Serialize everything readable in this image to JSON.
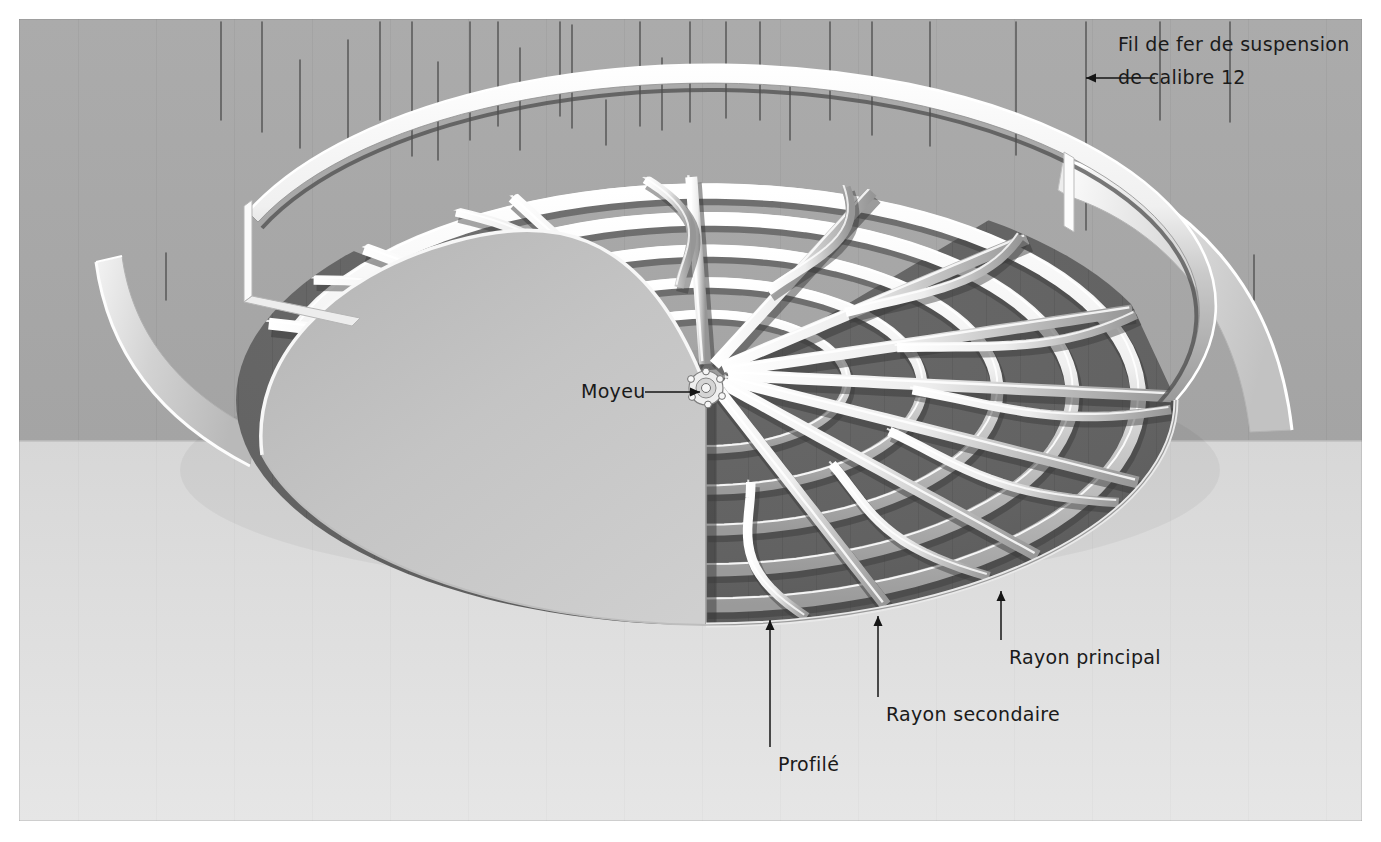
{
  "figure": {
    "kind": "technical-illustration",
    "frame": {
      "x": 18,
      "y": 18,
      "width": 1345,
      "height": 804,
      "border_color": "#6d6d6d"
    },
    "palette": {
      "wall": "#a9a9a9",
      "wall_dark": "#9d9d9d",
      "floor": "#dcdcdc",
      "dome_face": "#c3c3c3",
      "panel_dark": "#636363",
      "panel_darker": "#585858",
      "rib_light": "#f2f2f2",
      "rib_shadow": "#8f8f8f",
      "skirt": "#cfcfcf",
      "wire": "#4a4a4a",
      "ink": "#1a1a1a"
    },
    "wall_floor_y": 441
  },
  "labels": [
    {
      "id": "suspension-wire",
      "line1": "Fil de fer de suspension",
      "line2": "de calibre 12",
      "text_x": 1118,
      "text_y": 33,
      "arrow": {
        "x1": 1155,
        "y1": 78,
        "x2": 1086,
        "y2": 78,
        "direction": "left"
      }
    },
    {
      "id": "hub",
      "text": "Moyeu",
      "text_x": 581,
      "text_y": 380,
      "arrow": {
        "x1": 645,
        "y1": 392,
        "x2": 700,
        "y2": 392,
        "direction": "right"
      }
    },
    {
      "id": "main-ray",
      "text": "Rayon principal",
      "text_x": 1009,
      "text_y": 646,
      "arrow": {
        "x1": 1001,
        "y1": 640,
        "x2": 1001,
        "y2": 591,
        "direction": "up"
      }
    },
    {
      "id": "secondary-ray",
      "text": "Rayon secondaire",
      "text_x": 886,
      "text_y": 703,
      "arrow": {
        "x1": 878,
        "y1": 697,
        "x2": 878,
        "y2": 616,
        "direction": "up"
      }
    },
    {
      "id": "profile",
      "text": "Profilé",
      "text_x": 778,
      "text_y": 753,
      "arrow": {
        "x1": 770,
        "y1": 747,
        "x2": 770,
        "y2": 620,
        "direction": "up"
      }
    }
  ],
  "geometry": {
    "dome": {
      "center_x": 706,
      "center_y": 388,
      "rim_rx": 470,
      "rim_ry": 225,
      "rim_cy": 400,
      "hub_radius": 17
    },
    "counts": {
      "main_rays": 11,
      "secondary_rays": 10,
      "concentric_profiles": 5,
      "suspension_wires": 26
    }
  },
  "suspension_wires": [
    {
      "x": 166,
      "y1": 253,
      "y2": 300
    },
    {
      "x": 221,
      "y1": 22,
      "y2": 120
    },
    {
      "x": 262,
      "y1": 22,
      "y2": 132
    },
    {
      "x": 300,
      "y1": 60,
      "y2": 148
    },
    {
      "x": 348,
      "y1": 40,
      "y2": 150
    },
    {
      "x": 380,
      "y1": 22,
      "y2": 120
    },
    {
      "x": 412,
      "y1": 22,
      "y2": 156
    },
    {
      "x": 438,
      "y1": 62,
      "y2": 160
    },
    {
      "x": 470,
      "y1": 22,
      "y2": 140
    },
    {
      "x": 498,
      "y1": 22,
      "y2": 126
    },
    {
      "x": 520,
      "y1": 48,
      "y2": 150
    },
    {
      "x": 560,
      "y1": 22,
      "y2": 116
    },
    {
      "x": 572,
      "y1": 25,
      "y2": 128
    },
    {
      "x": 606,
      "y1": 100,
      "y2": 145
    },
    {
      "x": 640,
      "y1": 22,
      "y2": 126
    },
    {
      "x": 662,
      "y1": 58,
      "y2": 130
    },
    {
      "x": 690,
      "y1": 22,
      "y2": 122
    },
    {
      "x": 726,
      "y1": 22,
      "y2": 118
    },
    {
      "x": 760,
      "y1": 22,
      "y2": 120
    },
    {
      "x": 790,
      "y1": 85,
      "y2": 140
    },
    {
      "x": 830,
      "y1": 22,
      "y2": 120
    },
    {
      "x": 872,
      "y1": 22,
      "y2": 135
    },
    {
      "x": 930,
      "y1": 22,
      "y2": 146
    },
    {
      "x": 1016,
      "y1": 22,
      "y2": 155
    },
    {
      "x": 1086,
      "y1": 22,
      "y2": 230
    },
    {
      "x": 1160,
      "y1": 22,
      "y2": 120
    },
    {
      "x": 1230,
      "y1": 22,
      "y2": 122
    },
    {
      "x": 1254,
      "y1": 255,
      "y2": 300
    }
  ]
}
